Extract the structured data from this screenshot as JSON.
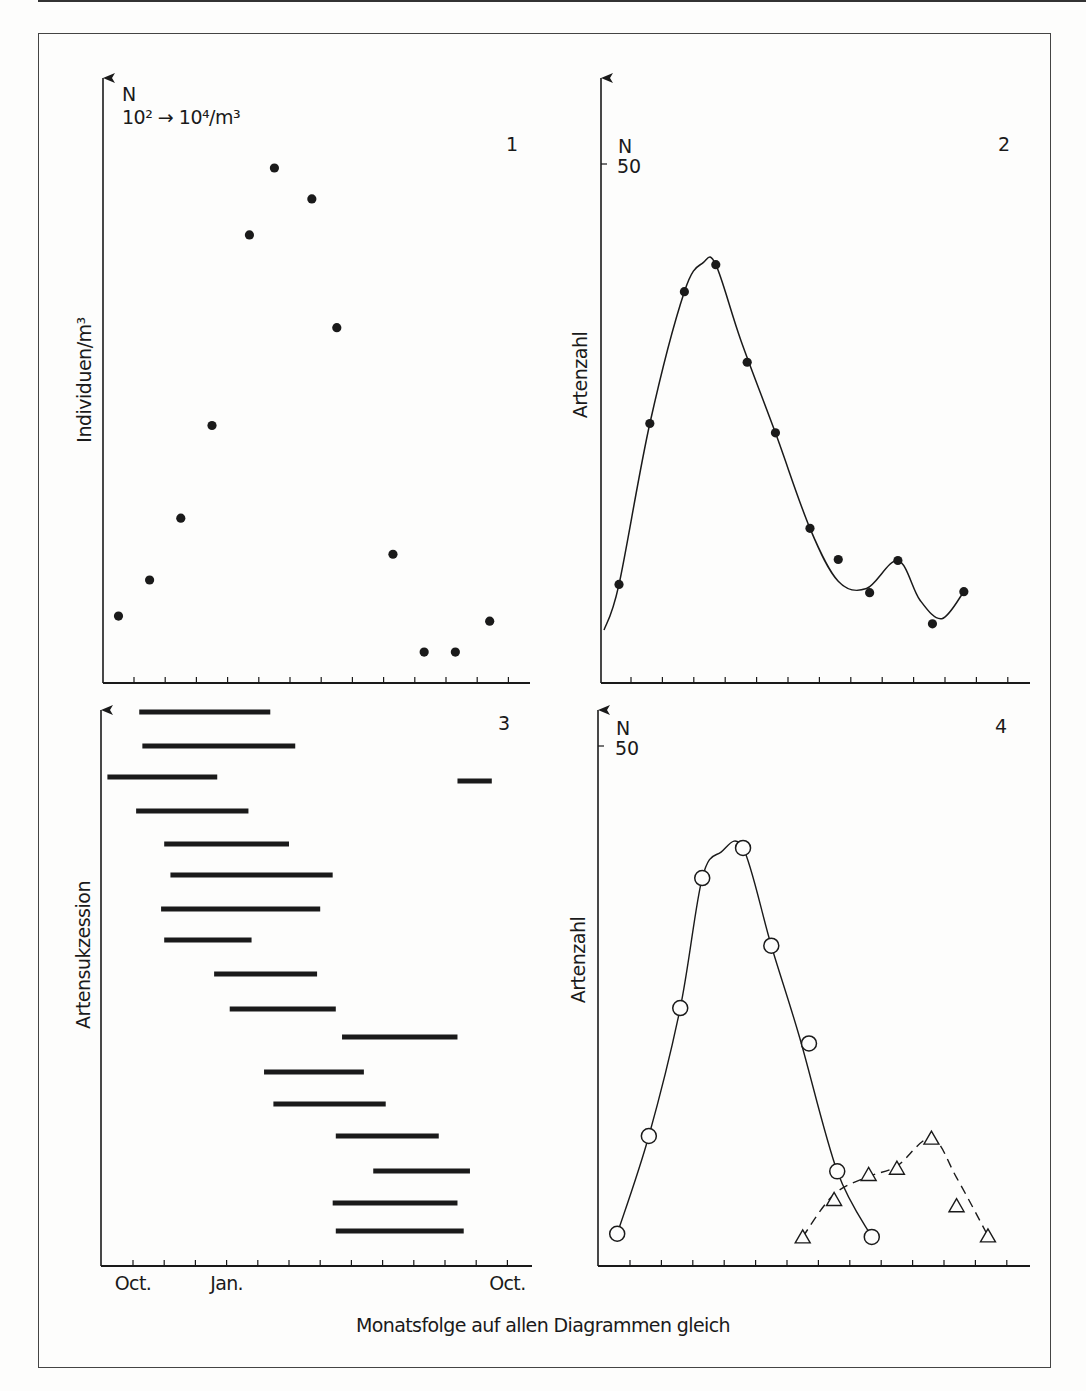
{
  "caption": "Monatsfolge auf allen Diagrammen gleich",
  "x_axis_labels": [
    {
      "text": "Oct.",
      "tick_index": 0
    },
    {
      "text": "Jan.",
      "tick_index": 3
    },
    {
      "text": "Oct.",
      "tick_index": 12
    }
  ],
  "colors": {
    "ink": "#1a1a1a",
    "paper": "#fdfdfc",
    "frame": "#444444"
  },
  "chart_data": [
    {
      "id": 1,
      "panel_label": "1",
      "type": "scatter",
      "title": "",
      "ylabel": "Individuen/m³",
      "y_axis_note_line1": "N",
      "y_axis_note_line2": "10² → 10⁴/m³",
      "xlabel": "Monatsfolge",
      "x_ticks": 13,
      "x": [
        0.5,
        1.5,
        2.5,
        3.5,
        4.7,
        5.5,
        6.7,
        7.5,
        9.3,
        10.3,
        11.3,
        12.4
      ],
      "values_relative": [
        0.13,
        0.2,
        0.32,
        0.5,
        0.87,
        1.0,
        0.94,
        0.69,
        0.25,
        0.06,
        0.06,
        0.12
      ],
      "ylim": [
        0,
        1.1
      ]
    },
    {
      "id": 2,
      "panel_label": "2",
      "type": "line",
      "ylabel": "Artenzahl",
      "y_axis_note": "N",
      "y_tick_label": "50",
      "ylim": [
        0,
        50
      ],
      "x_ticks": 13,
      "points": {
        "x": [
          0.6,
          1.6,
          2.7,
          3.7,
          4.7,
          5.6,
          6.7,
          7.6,
          8.6,
          9.5,
          10.6,
          11.6
        ],
        "y": [
          9.5,
          25.0,
          37.7,
          40.3,
          30.9,
          24.1,
          14.9,
          11.9,
          8.7,
          11.8,
          5.7,
          8.8
        ]
      },
      "curve": {
        "x": [
          0.1,
          0.6,
          1.6,
          2.7,
          3.3,
          3.7,
          4.5,
          5.6,
          6.7,
          7.6,
          8.5,
          9.5,
          10.2,
          10.9,
          11.6
        ],
        "y": [
          5.1,
          9.5,
          25.0,
          37.7,
          40.5,
          40.3,
          33.0,
          24.1,
          14.9,
          9.8,
          9.1,
          11.8,
          8.0,
          6.2,
          8.8
        ]
      }
    },
    {
      "id": 3,
      "panel_label": "3",
      "type": "gantt",
      "ylabel": "Artensukzession",
      "x_ticks": 13,
      "bars": [
        {
          "start": 1.2,
          "end": 5.4
        },
        {
          "start": 1.3,
          "end": 6.2
        },
        {
          "start": 0.2,
          "end": 3.7
        },
        {
          "start": 1.1,
          "end": 4.7
        },
        {
          "start": 2.0,
          "end": 6.0
        },
        {
          "start": 2.2,
          "end": 7.4
        },
        {
          "start": 1.9,
          "end": 7.0
        },
        {
          "start": 2.0,
          "end": 4.8
        },
        {
          "start": 3.6,
          "end": 6.9
        },
        {
          "start": 4.1,
          "end": 7.5
        },
        {
          "start": 7.7,
          "end": 11.4
        },
        {
          "start": 5.2,
          "end": 8.4
        },
        {
          "start": 5.5,
          "end": 9.1
        },
        {
          "start": 7.5,
          "end": 10.8
        },
        {
          "start": 8.7,
          "end": 11.8
        },
        {
          "start": 7.4,
          "end": 11.4
        },
        {
          "start": 7.5,
          "end": 11.6
        }
      ],
      "extra_bars": [
        {
          "row": 2,
          "start": 11.4,
          "end": 12.5
        }
      ]
    },
    {
      "id": 4,
      "panel_label": "4",
      "type": "line",
      "ylabel": "Artenzahl",
      "y_axis_note": "N",
      "y_tick_label": "50",
      "ylim": [
        0,
        50
      ],
      "x_ticks": 13,
      "series": [
        {
          "name": "circles",
          "marker": "open-circle",
          "line": "solid",
          "x": [
            0.6,
            1.6,
            2.6,
            3.3,
            4.6,
            5.5,
            6.7,
            7.6,
            8.7
          ],
          "y": [
            3.1,
            12.5,
            24.8,
            37.3,
            40.2,
            30.8,
            21.4,
            9.1,
            2.8
          ],
          "curve_x": [
            0.6,
            1.6,
            2.6,
            3.3,
            3.9,
            4.6,
            5.5,
            6.4,
            7.6,
            8.7
          ],
          "curve_y": [
            3.1,
            12.5,
            24.8,
            37.3,
            39.8,
            40.2,
            30.8,
            22.0,
            9.1,
            2.8
          ],
          "outlier_index": 6
        },
        {
          "name": "triangles",
          "marker": "open-triangle",
          "line": "dashed",
          "x": [
            6.5,
            7.5,
            8.6,
            9.5,
            10.6,
            11.4,
            12.4
          ],
          "y": [
            2.8,
            6.4,
            8.8,
            9.4,
            12.3,
            5.8,
            2.9
          ],
          "curve_x": [
            6.5,
            7.5,
            8.6,
            9.5,
            10.6,
            11.4,
            12.4
          ],
          "curve_y": [
            2.8,
            6.9,
            8.6,
            9.6,
            12.3,
            8.5,
            2.9
          ]
        }
      ]
    }
  ]
}
